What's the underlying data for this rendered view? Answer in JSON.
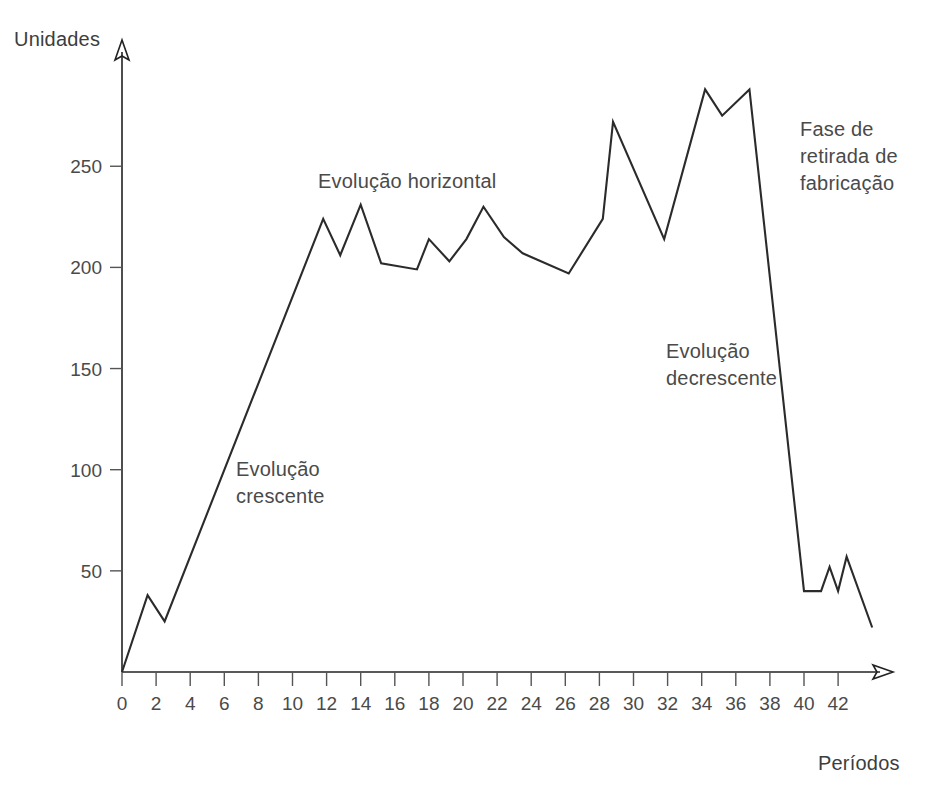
{
  "chart_data": {
    "type": "line",
    "title": "",
    "xlabel": "Períodos",
    "ylabel": "Unidades",
    "xlim": [
      0,
      44
    ],
    "ylim": [
      0,
      300
    ],
    "grid": false,
    "legend": null,
    "x_ticks": [
      0,
      2,
      4,
      6,
      8,
      10,
      12,
      14,
      16,
      18,
      20,
      22,
      24,
      26,
      28,
      30,
      32,
      34,
      36,
      38,
      40,
      42
    ],
    "x_tick_labels": [
      "0",
      "2",
      "4",
      "6",
      "8",
      "10",
      "12",
      "14",
      "16",
      "18",
      "20",
      "22",
      "24",
      "26",
      "28",
      "30",
      "32",
      "34",
      "36",
      "38",
      "40",
      "42"
    ],
    "y_ticks": [
      50,
      100,
      150,
      200,
      250
    ],
    "y_tick_labels": [
      "50",
      "100",
      "150",
      "200",
      "250"
    ],
    "series": [
      {
        "name": "Unidades por período",
        "color": "#2b2b2b",
        "x": [
          0,
          1.5,
          2.5,
          11.8,
          12.8,
          14.0,
          15.2,
          17.3,
          18.0,
          19.2,
          20.2,
          21.2,
          22.4,
          23.5,
          26.2,
          28.2,
          28.8,
          31.8,
          34.2,
          35.2,
          36.8,
          40.0,
          41.0,
          41.5,
          42.0,
          42.5,
          44.0
        ],
        "y": [
          0,
          38,
          25,
          224,
          206,
          231,
          202,
          199,
          214,
          203,
          214,
          230,
          215,
          207,
          197,
          224,
          272,
          214,
          288,
          275,
          288,
          40,
          40,
          52,
          40,
          57,
          22
        ]
      }
    ],
    "annotations": [
      {
        "id": "crescente",
        "text": "Evolução\ncrescente",
        "x": 8,
        "y": 100
      },
      {
        "id": "horizontal",
        "text": "Evolução horizontal",
        "x": 20,
        "y": 245
      },
      {
        "id": "decrescente",
        "text": "Evolução\ndecrescente",
        "x": 33,
        "y": 155
      },
      {
        "id": "retirada",
        "text": "Fase de\nretirada de\nfabricação",
        "x": 41,
        "y": 260
      }
    ]
  },
  "axes": {
    "y_title": "Unidades",
    "x_title": "Períodos"
  },
  "annotation_text": {
    "crescente": "Evolução\ncrescente",
    "horizontal": "Evolução horizontal",
    "decrescente": "Evolução\ndecrescente",
    "retirada": "Fase de\nretirada de\nfabricação"
  },
  "colors": {
    "line": "#2b2b2b",
    "axis": "#222222",
    "text": "#4a4a4a",
    "background": "#ffffff"
  }
}
